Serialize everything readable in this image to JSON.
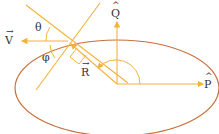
{
  "diagram": {
    "labels": {
      "V": "V",
      "theta": "θ",
      "phi": "φ",
      "R": "R",
      "Q": "Q",
      "P": "P"
    },
    "colors": {
      "orbit": "#c8703a",
      "vectors": "#f2b33d",
      "text": "#333333"
    }
  }
}
